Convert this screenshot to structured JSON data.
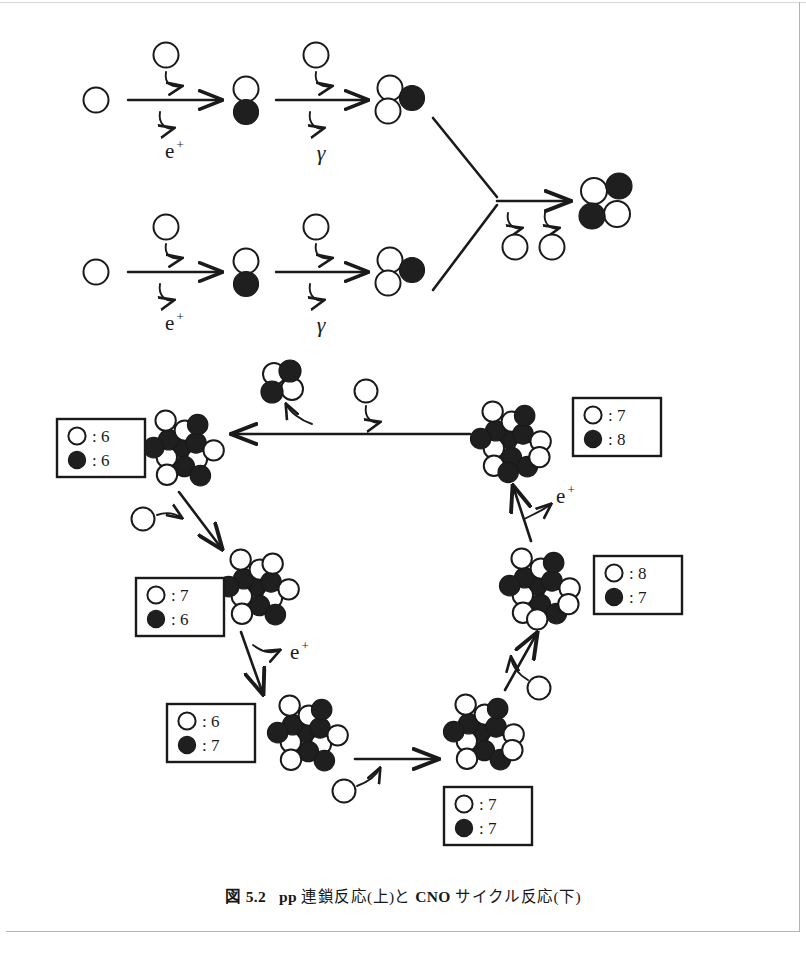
{
  "figure": {
    "caption_prefix": "図 5.2",
    "caption_main": "pp 連鎖反応(上)と CNO サイクル反応(下)",
    "caption_full": "図 5.2   pp 連鎖反応(上)と CNO サイクル反応(下)",
    "caption_part_pp": "pp",
    "caption_part_chain": "連鎖反応(上)と",
    "caption_part_cno": "CNO",
    "caption_part_cycle": "サイクル反応(下)"
  },
  "legend": {
    "proton_symbol": "○",
    "neutron_symbol": "●",
    "colon": ":"
  },
  "colors": {
    "ink": "#1a1a1a",
    "proton_fill": "#ffffff",
    "neutron_fill": "#1f1f1f",
    "stroke": "#1a1a1a",
    "page_rule": "#b4b4b4"
  },
  "pp_chain": {
    "title": "pp chain reaction",
    "rows": [
      {
        "row": 1,
        "steps": [
          {
            "label_emitted": "e",
            "label_sup": "+",
            "input": "proton",
            "product": "deuteron"
          },
          {
            "label_emitted": "γ",
            "label_sup": "",
            "input": "proton",
            "product": "helium-3"
          }
        ]
      },
      {
        "row": 2,
        "steps": [
          {
            "label_emitted": "e",
            "label_sup": "+",
            "input": "proton",
            "product": "deuteron"
          },
          {
            "label_emitted": "γ",
            "label_sup": "",
            "input": "proton",
            "product": "helium-3"
          }
        ]
      }
    ],
    "emitted_labels": [
      "e",
      "+",
      "γ",
      "e",
      "+",
      "γ"
    ],
    "final_product": "helium-4",
    "released_protons": 2
  },
  "cno_cycle": {
    "title": "CNO cycle reaction",
    "nuclei": [
      {
        "id": "c12",
        "name": "carbon-12",
        "protons": 6,
        "neutrons": 7,
        "box_protons": "6",
        "box_neutrons": "6"
      },
      {
        "id": "n13",
        "name": "nitrogen-13",
        "protons": 7,
        "neutrons": 6,
        "box_protons": "7",
        "box_neutrons": "6"
      },
      {
        "id": "c13",
        "name": "carbon-13",
        "protons": 6,
        "neutrons": 7,
        "box_protons": "6",
        "box_neutrons": "7"
      },
      {
        "id": "n14",
        "name": "nitrogen-14",
        "protons": 7,
        "neutrons": 7,
        "box_protons": "7",
        "box_neutrons": "7"
      },
      {
        "id": "o15",
        "name": "oxygen-15",
        "protons": 8,
        "neutrons": 7,
        "box_protons": "8",
        "box_neutrons": "7"
      },
      {
        "id": "n15",
        "name": "nitrogen-15",
        "protons": 7,
        "neutrons": 8,
        "box_protons": "7",
        "box_neutrons": "8"
      }
    ],
    "emitted_labels": [
      "e",
      "+",
      "e",
      "+"
    ],
    "positron_label": "e",
    "positron_sup": "+",
    "alpha_product": "helium-4"
  }
}
